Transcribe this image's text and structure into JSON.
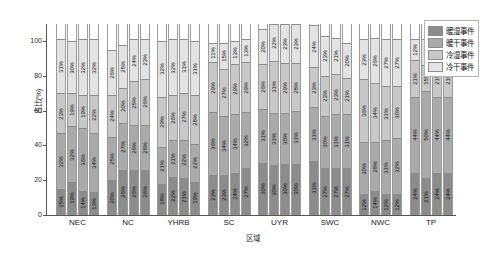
{
  "chart_data": {
    "type": "bar",
    "subtype": "stacked-percent-grouped",
    "title": "",
    "xlabel": "区域",
    "ylabel": "占比(%)",
    "ylim": [
      0,
      100
    ],
    "yticks": [
      "0",
      "20",
      "40",
      "60",
      "80",
      "100"
    ],
    "grid": false,
    "legend_position": "right-top",
    "categories": [
      "NEC",
      "NC",
      "YHRB",
      "SC",
      "UYR",
      "SWC",
      "NWC",
      "TP"
    ],
    "bars_per_category": 4,
    "series": [
      {
        "name": "冷干事件",
        "color": "#e3e3e3",
        "values": [
          [
            31,
            30,
            32,
            32
          ],
          [
            26,
            25,
            24,
            23
          ],
          [
            32,
            32,
            31,
            31
          ],
          [
            11,
            15,
            13,
            13
          ],
          [
            20,
            22,
            23,
            23
          ],
          [
            24,
            23,
            21,
            20
          ],
          [
            23,
            26,
            27,
            27
          ],
          [
            12,
            15,
            12,
            12
          ]
        ]
      },
      {
        "name": "冷湿事件",
        "color": "#c8c8c8",
        "values": [
          [
            23,
            19,
            19,
            22
          ],
          [
            24,
            20,
            25,
            26
          ],
          [
            29,
            26,
            27,
            28
          ],
          [
            29,
            27,
            29,
            29
          ],
          [
            26,
            31,
            29,
            28
          ],
          [
            23,
            23,
            23,
            21
          ],
          [
            36,
            34,
            31,
            30
          ],
          [
            21,
            15,
            21,
            21
          ]
        ]
      },
      {
        "name": "暖干事件",
        "color": "#aaaaaa",
        "values": [
          [
            32,
            32,
            36,
            34
          ],
          [
            25,
            27,
            26,
            26
          ],
          [
            21,
            21,
            22,
            22
          ],
          [
            36,
            34,
            34,
            32
          ],
          [
            31,
            31,
            30,
            31
          ],
          [
            31,
            30,
            31,
            31
          ],
          [
            30,
            28,
            31,
            32
          ],
          [
            44,
            50,
            44,
            44
          ]
        ]
      },
      {
        "name": "暖湿事件",
        "color": "#8c8c8c",
        "values": [
          [
            15,
            19,
            14,
            13
          ],
          [
            20,
            26,
            26,
            26
          ],
          [
            18,
            22,
            21,
            19
          ],
          [
            23,
            23,
            24,
            27
          ],
          [
            30,
            30,
            30,
            30
          ],
          [
            31,
            27,
            27,
            27
          ],
          [
            12,
            14,
            12,
            12
          ],
          [
            24,
            21,
            24,
            24
          ]
        ]
      }
    ],
    "segment_order_bottom_to_top": [
      "暖湿事件",
      "暖干事件",
      "冷湿事件",
      "冷干事件"
    ]
  },
  "legend": {
    "items": [
      {
        "label": "暖湿事件",
        "color": "#8c8c8c"
      },
      {
        "label": "暖干事件",
        "color": "#aaaaaa"
      },
      {
        "label": "冷湿事件",
        "color": "#c8c8c8"
      },
      {
        "label": "冷干事件",
        "color": "#e3e3e3"
      }
    ]
  },
  "axes": {
    "y_title": "占比(%)",
    "x_title": "区域",
    "y_ticks": [
      "100",
      "80",
      "60",
      "40",
      "20",
      "0"
    ]
  }
}
